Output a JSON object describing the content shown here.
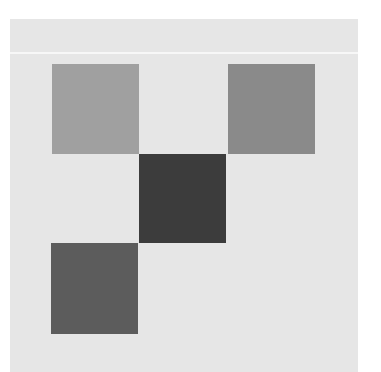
{
  "canvas": {
    "background": "#ffffff",
    "panel_color": "#e6e6e6",
    "divider_color": "#f7f7f7"
  },
  "squares": [
    {
      "name": "top-left",
      "row": 0,
      "col": 0,
      "color": "#a0a0a0"
    },
    {
      "name": "top-right",
      "row": 0,
      "col": 2,
      "color": "#8a8a8a"
    },
    {
      "name": "center",
      "row": 1,
      "col": 1,
      "color": "#3c3c3c"
    },
    {
      "name": "bottom-left",
      "row": 2,
      "col": 0,
      "color": "#5c5c5c"
    }
  ]
}
